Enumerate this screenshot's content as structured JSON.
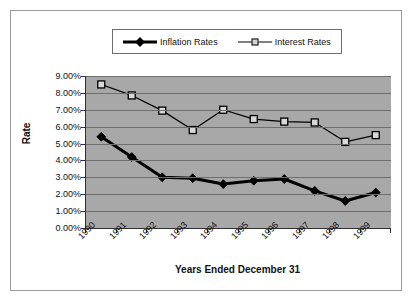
{
  "figure": {
    "top_caption": "",
    "yaxis_title": "Rate",
    "xaxis_title": "Years Ended December 31"
  },
  "legend": {
    "position": "top-center",
    "entries": [
      {
        "label": "Inflation Rates",
        "marker": "filled-diamond",
        "color": "#000000",
        "line": "thick"
      },
      {
        "label": "Interest Rates",
        "marker": "open-square",
        "color": "#000000",
        "line": "thin"
      }
    ]
  },
  "chart_data": {
    "type": "line",
    "title": "",
    "xlabel": "Years Ended December 31",
    "ylabel": "Rate",
    "categories": [
      "1990",
      "1991",
      "1992",
      "1993",
      "1994",
      "1995",
      "1996",
      "1997",
      "1998",
      "1999"
    ],
    "ylim": [
      0,
      9
    ],
    "ytick_labels": [
      "0.00%",
      "1.00%",
      "2.00%",
      "3.00%",
      "4.00%",
      "5.00%",
      "6.00%",
      "7.00%",
      "8.00%",
      "9.00%"
    ],
    "ytick_values": [
      0,
      1,
      2,
      3,
      4,
      5,
      6,
      7,
      8,
      9
    ],
    "grid": true,
    "legend_position": "top",
    "plot_background": "#a8a8a8",
    "series": [
      {
        "name": "Inflation Rates",
        "marker": "filled-diamond",
        "color": "#000000",
        "values": [
          5.4,
          4.2,
          3.0,
          2.95,
          2.6,
          2.8,
          2.9,
          2.2,
          1.6,
          2.1
        ]
      },
      {
        "name": "Interest Rates",
        "marker": "open-square",
        "color": "#000000",
        "values": [
          8.5,
          7.85,
          6.95,
          5.8,
          7.0,
          6.45,
          6.3,
          6.25,
          5.1,
          5.5
        ]
      }
    ]
  }
}
